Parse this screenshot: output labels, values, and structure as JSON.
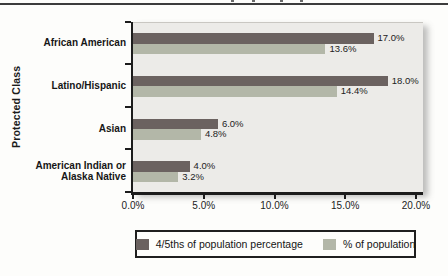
{
  "figure": {
    "top_rule_color": "#3c3c3c",
    "background": "#fdfdfb"
  },
  "chart_data": {
    "type": "bar",
    "orientation": "horizontal",
    "ylabel": "Protected Class",
    "xlim": [
      0,
      20
    ],
    "x_tick_labels": [
      "0.0%",
      "5.0%",
      "10.0%",
      "15.0%",
      "20.0%"
    ],
    "categories": [
      {
        "lines": [
          "African American"
        ]
      },
      {
        "lines": [
          "Latino/Hispanic"
        ]
      },
      {
        "lines": [
          "Asian"
        ]
      },
      {
        "lines": [
          "American Indian or",
          "Alaska Native"
        ]
      }
    ],
    "series": [
      {
        "name": "4/5ths of population percentage",
        "color": "#6b6260",
        "values": [
          17.0,
          18.0,
          6.0,
          4.0
        ],
        "value_labels": [
          "17.0%",
          "18.0%",
          "6.0%",
          "4.0%"
        ]
      },
      {
        "name": "% of population",
        "color": "#b3b7a8",
        "values": [
          13.6,
          14.4,
          4.8,
          3.2
        ],
        "value_labels": [
          "13.6%",
          "14.4%",
          "4.8%",
          "3.2%"
        ]
      }
    ],
    "legend_position": "bottom",
    "plot_background": "#ecebe8",
    "axis_color": "#1c1c1c"
  }
}
